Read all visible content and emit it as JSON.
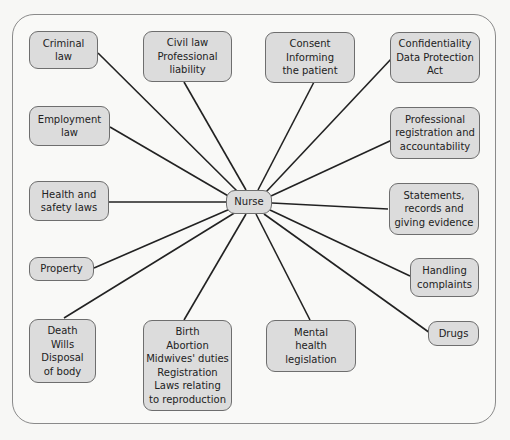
{
  "diagram": {
    "center": {
      "label": "Nurse"
    },
    "nodes": [
      {
        "id": "criminal-law",
        "lines": [
          "Criminal",
          "law"
        ]
      },
      {
        "id": "civil-law",
        "lines": [
          "Civil law",
          "Professional",
          "liability"
        ]
      },
      {
        "id": "consent",
        "lines": [
          "Consent",
          "Informing",
          "the patient"
        ]
      },
      {
        "id": "confidentiality",
        "lines": [
          "Confidentiality",
          "Data Protection",
          "Act"
        ]
      },
      {
        "id": "employment-law",
        "lines": [
          "Employment",
          "law"
        ]
      },
      {
        "id": "professional-registration",
        "lines": [
          "Professional",
          "registration and",
          "accountability"
        ]
      },
      {
        "id": "health-safety",
        "lines": [
          "Health and",
          "safety laws"
        ]
      },
      {
        "id": "statements-records",
        "lines": [
          "Statements,",
          "records and",
          "giving evidence"
        ]
      },
      {
        "id": "property",
        "lines": [
          "Property"
        ]
      },
      {
        "id": "handling-complaints",
        "lines": [
          "Handling",
          "complaints"
        ]
      },
      {
        "id": "drugs",
        "lines": [
          "Drugs"
        ]
      },
      {
        "id": "death",
        "lines": [
          "Death",
          "Wills",
          "Disposal",
          "of body"
        ]
      },
      {
        "id": "birth",
        "lines": [
          "Birth",
          "Abortion",
          "Midwives' duties",
          "Registration",
          "Laws relating",
          "to reproduction"
        ]
      },
      {
        "id": "mental-health",
        "lines": [
          "Mental",
          "health",
          "legislation"
        ]
      }
    ]
  }
}
